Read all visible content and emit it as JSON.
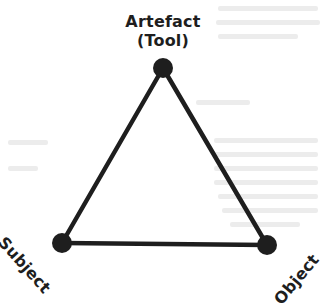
{
  "diagram": {
    "title_top": {
      "line1": "Artefact",
      "line2": "(Tool)"
    },
    "vertices": [
      {
        "id": "artefact",
        "label": "Artefact (Tool)",
        "x": 163,
        "y": 68
      },
      {
        "id": "subject",
        "label": "Subject",
        "x": 62,
        "y": 243
      },
      {
        "id": "object",
        "label": "Object",
        "x": 267,
        "y": 245
      }
    ],
    "labels": {
      "subject": "Subject",
      "object": "Object"
    },
    "colors": {
      "stroke": "#1e1e1e",
      "node": "#1e1e1e",
      "background": "#ffffff",
      "bleed_through_text": "#ececec"
    }
  }
}
